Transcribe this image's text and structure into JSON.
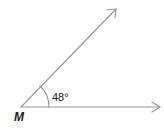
{
  "diagram": {
    "vertex_label": "M",
    "angle_label": "48°",
    "angle_degrees": 48,
    "line_color": "#9a9a9a",
    "text_color": "#222222"
  }
}
